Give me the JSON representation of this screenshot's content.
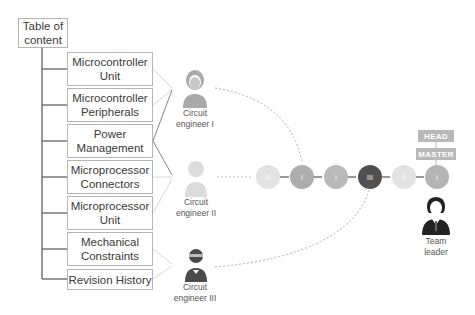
{
  "toc": {
    "title": "Table of\ncontent",
    "items": [
      {
        "label": "Microcontroller\nUnit"
      },
      {
        "label": "Microcontroller\nPeripherals"
      },
      {
        "label": "Power\nManagement"
      },
      {
        "label": "Microprocessor\nConnectors"
      },
      {
        "label": "Microprocessor\nUnit"
      },
      {
        "label": "Mechanical\nConstraints"
      },
      {
        "label": "Revision History"
      }
    ]
  },
  "engineers": [
    {
      "label": "Circuit\nengineer I",
      "color": "#a9a9a9"
    },
    {
      "label": "Circuit\nengineer II",
      "color": "#dcdcdc"
    },
    {
      "label": "Circuit\nengineer III",
      "color": "#4a4a4a"
    }
  ],
  "commits": [
    {
      "label": "III",
      "color": "#e3e3e3"
    },
    {
      "label": "I",
      "color": "#adadad"
    },
    {
      "label": "I",
      "color": "#b9b9b9"
    },
    {
      "label": "III",
      "color": "#505050"
    },
    {
      "label": "II",
      "color": "#e3e3e3"
    },
    {
      "label": "I",
      "color": "#b5b5b5"
    }
  ],
  "tags": {
    "head": "HEAD",
    "master": "MASTER"
  },
  "team_leader": {
    "label": "Team\nleader"
  }
}
